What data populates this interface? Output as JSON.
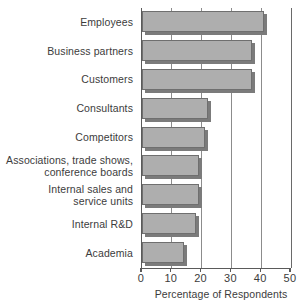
{
  "chart_data": {
    "type": "bar",
    "orientation": "horizontal",
    "title": "",
    "xlabel": "Percentage of Respondents",
    "ylabel": "",
    "xlim": [
      0,
      50
    ],
    "xticks": [
      0,
      10,
      20,
      30,
      40,
      50
    ],
    "xtick_labels": [
      "0",
      "10",
      "20",
      "30",
      "40",
      "50"
    ],
    "grid": "vertical",
    "legend": "none",
    "categories": [
      "Employees",
      "Business partners",
      "Customers",
      "Consultants",
      "Competitors",
      "Associations, trade shows,\nconference boards",
      "Internal sales and\nservice units",
      "Internal R&D",
      "Academia"
    ],
    "values": [
      41,
      37,
      37,
      22,
      21,
      19,
      19,
      18,
      14
    ],
    "series": [
      {
        "name": "Percentage of Respondents",
        "values": [
          41,
          37,
          37,
          22,
          21,
          19,
          19,
          18,
          14
        ]
      }
    ],
    "colors": {
      "bar_fill": "#aeaeae",
      "bar_border": "#6f6f6f",
      "bar_shadow": "#7b7b7b",
      "axis": "#5a5a5a",
      "gridline": "#8c8c8c",
      "text": "#3c3c3c",
      "background": "#ffffff"
    }
  }
}
